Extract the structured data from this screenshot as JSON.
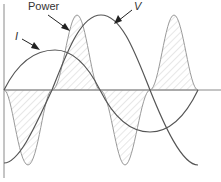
{
  "diagram": {
    "type": "waveform",
    "labels": {
      "power": "Power",
      "voltage": "V",
      "current": "I"
    },
    "curves": [
      {
        "name": "V",
        "description": "voltage sine wave",
        "zero_crossings_px": [
          52,
          150
        ],
        "peak_px": [
          101,
          15
        ]
      },
      {
        "name": "I",
        "description": "current sine wave, lagging/leading by quarter period",
        "zero_crossings_px": [
          4,
          100,
          198
        ],
        "peak_px": [
          55,
          50
        ],
        "trough_px": [
          150,
          132
        ]
      },
      {
        "name": "Power",
        "description": "instantaneous power, hatched fill, alternating positive and negative lobes",
        "lobes": [
          "negative",
          "positive",
          "negative",
          "positive"
        ]
      }
    ],
    "colors": {
      "curve": "#555555",
      "power_curve": "#999999",
      "hatch": "#c8c8c8",
      "axis": "#888888"
    }
  }
}
